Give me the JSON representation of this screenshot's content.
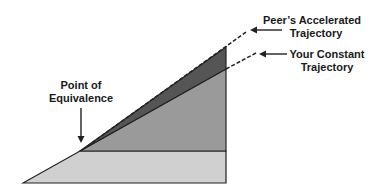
{
  "labels": {
    "peer_line1": "Peer’s Accelerated",
    "peer_line2": "Trajectory",
    "yours_line1": "Your Constant",
    "yours_line2": "Trajectory",
    "poe_line1": "Point of",
    "poe_line2": "Equivalence"
  },
  "colors": {
    "base_fill": "#d0d0d0",
    "mid_fill": "#9a9a9a",
    "dark_fill": "#555555",
    "stroke": "#222222"
  }
}
